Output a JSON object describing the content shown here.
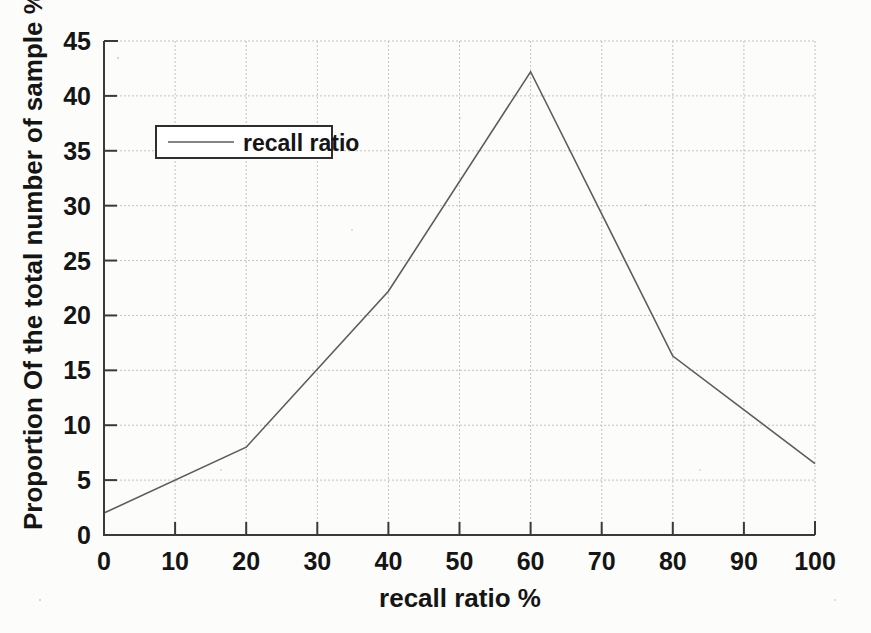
{
  "chart_data": {
    "type": "line",
    "title": "",
    "xlabel": "recall ratio %",
    "ylabel": "Proportion Of the total number of sample %",
    "x": [
      0,
      20,
      40,
      60,
      80,
      100
    ],
    "series": [
      {
        "name": "recall ratio",
        "values": [
          2.0,
          8.0,
          22.2,
          42.2,
          16.3,
          6.5
        ]
      }
    ],
    "xlim": [
      0,
      100
    ],
    "ylim": [
      0,
      45
    ],
    "xticks": [
      0,
      10,
      20,
      30,
      40,
      50,
      60,
      70,
      80,
      90,
      100
    ],
    "yticks": [
      0,
      5,
      10,
      15,
      20,
      25,
      30,
      35,
      40,
      45
    ],
    "xtick_labels": [
      "0",
      "10",
      "20",
      "30",
      "40",
      "50",
      "60",
      "70",
      "80",
      "90",
      "100"
    ],
    "ytick_labels": [
      "0",
      "5",
      "10",
      "15",
      "20",
      "25",
      "30",
      "35",
      "40",
      "45"
    ],
    "grid": true,
    "legend": {
      "entries": [
        "recall ratio"
      ],
      "position": "upper-left"
    },
    "line_color": "#5c5c5c",
    "grid_color": "#b9b9b9",
    "axis_color": "#3a3a3a",
    "background_color": "#fcfcfa"
  },
  "axes": {
    "x_title": "recall ratio %",
    "y_title": "Proportion Of the total number of sample %"
  },
  "legend": {
    "entry_label": "recall ratio"
  }
}
